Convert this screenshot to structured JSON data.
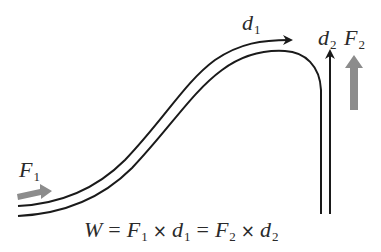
{
  "diagram": {
    "type": "work-ramp",
    "colors": {
      "track": "#1a1a1a",
      "force_arrow": "#8c8c8c",
      "text": "#2a2a2a",
      "background": "#ffffff"
    },
    "labels": {
      "f1": {
        "symbol": "F",
        "subscript": "1"
      },
      "d1": {
        "symbol": "d",
        "subscript": "1"
      },
      "d2": {
        "symbol": "d",
        "subscript": "2"
      },
      "f2": {
        "symbol": "F",
        "subscript": "2"
      }
    },
    "formula": {
      "w": "W",
      "eq1": "=",
      "f1": "F",
      "f1_sub": "1",
      "times1": "×",
      "d1": "d",
      "d1_sub": "1",
      "eq2": "=",
      "f2": "F",
      "f2_sub": "2",
      "times2": "×",
      "d2": "d",
      "d2_sub": "2"
    },
    "icons": {
      "f1_arrow": "gray-right-arrow",
      "f2_arrow": "gray-up-arrow",
      "d1_arrow": "black-curved-arrow",
      "d2_arrow": "black-up-arrow"
    }
  }
}
